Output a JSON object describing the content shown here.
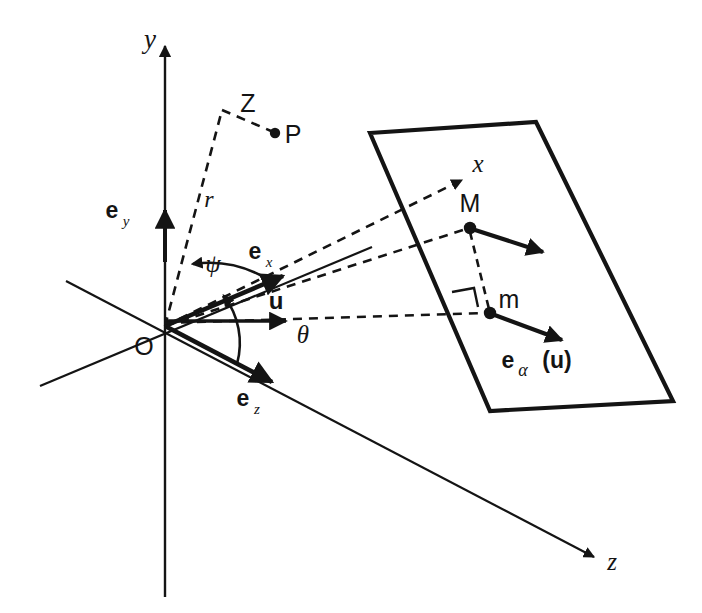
{
  "figure": {
    "type": "geometry-diagram",
    "background_color": "#ffffff",
    "stroke_color": "#141414"
  },
  "axes": [
    {
      "id": "y",
      "label": "y",
      "style": "italic",
      "x": 150,
      "y": 48
    },
    {
      "id": "x",
      "label": "x",
      "style": "italic",
      "x": 478,
      "y": 172
    },
    {
      "id": "z",
      "label": "z",
      "style": "italic",
      "x": 612,
      "y": 570
    }
  ],
  "unit_vectors": [
    {
      "id": "e_y",
      "base": "e",
      "sub": "y",
      "x": 112,
      "y": 218
    },
    {
      "id": "e_x",
      "base": "e",
      "sub": "x",
      "x": 255,
      "y": 259
    },
    {
      "id": "e_z",
      "base": "e",
      "sub": "z",
      "x": 243,
      "y": 406
    },
    {
      "id": "u",
      "base": "u",
      "sub": "",
      "x": 276,
      "y": 309
    }
  ],
  "vector_field": {
    "id": "e_alpha_u",
    "base": "e",
    "sub": "α",
    "arg": "(u)",
    "x": 508,
    "y": 368
  },
  "angles": [
    {
      "id": "psi",
      "label": "ψ",
      "x": 213,
      "y": 272,
      "between": [
        "e_x",
        "r"
      ]
    },
    {
      "id": "theta",
      "label": "θ",
      "x": 303,
      "y": 343,
      "between": [
        "u",
        "e_z"
      ]
    }
  ],
  "points": [
    {
      "id": "O",
      "label": "O",
      "px": 165,
      "py": 326,
      "lx": 144,
      "ly": 355,
      "dot": false
    },
    {
      "id": "Z",
      "label": "Z",
      "px": 222,
      "py": 110,
      "lx": 248,
      "ly": 112,
      "dot": false
    },
    {
      "id": "P",
      "label": "P",
      "px": 275,
      "py": 133,
      "lx": 287,
      "ly": 143,
      "dot": true
    },
    {
      "id": "M",
      "label": "M",
      "px": 470,
      "py": 228,
      "lx": 462,
      "ly": 216,
      "dot": true
    },
    {
      "id": "m",
      "label": "m",
      "px": 490,
      "py": 313,
      "lx": 500,
      "ly": 310,
      "dot": true
    }
  ],
  "segments": [
    {
      "id": "r",
      "label": "r",
      "style": "italic",
      "x": 209,
      "y": 207,
      "from": "O",
      "to": "Z",
      "dashed": true
    }
  ],
  "markers": [
    {
      "id": "right-angle",
      "at": "m",
      "type": "square"
    }
  ],
  "plane": {
    "id": "inclined-plane",
    "corners": [
      [
        370,
        133
      ],
      [
        536,
        122
      ],
      [
        673,
        401
      ],
      [
        490,
        411
      ]
    ]
  }
}
